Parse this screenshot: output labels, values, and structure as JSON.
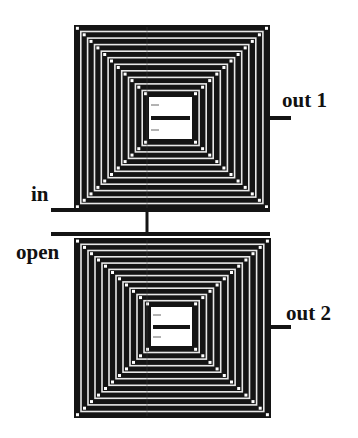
{
  "diagram": {
    "type": "stacked planar spiral coils (transformer)",
    "colors": {
      "trace": "#141414",
      "gap": "#ffffff",
      "background": "#ffffff"
    },
    "coils": [
      {
        "id": "coil-1",
        "x": 74,
        "y": 25,
        "w": 196,
        "h": 185,
        "turns": 11,
        "pitch": 7.3,
        "window": {
          "x": 149,
          "y": 97,
          "w": 43,
          "h": 42
        },
        "bar_y": 118
      },
      {
        "id": "coil-2",
        "x": 74,
        "y": 238,
        "w": 197,
        "h": 180,
        "turns": 11,
        "pitch": 7.0,
        "window": {
          "x": 151,
          "y": 307,
          "w": 41,
          "h": 39
        },
        "bar_y": 327
      }
    ],
    "labels": {
      "out1": "out 1",
      "in": "in",
      "open": "open",
      "out2": "out 2"
    },
    "leads": [
      {
        "name": "in-lead",
        "x1": 51,
        "y1": 210,
        "x2": 270,
        "y2": 210
      },
      {
        "name": "open-lead",
        "x1": 51,
        "y1": 234,
        "x2": 270,
        "y2": 234
      },
      {
        "name": "out1-lead",
        "x1": 270,
        "y1": 118,
        "x2": 291,
        "y2": 118
      },
      {
        "name": "out2-lead",
        "x1": 271,
        "y1": 327,
        "x2": 291,
        "y2": 327
      },
      {
        "name": "interconnect",
        "x1": 147,
        "y1": 210,
        "x2": 147,
        "y2": 234
      }
    ]
  }
}
